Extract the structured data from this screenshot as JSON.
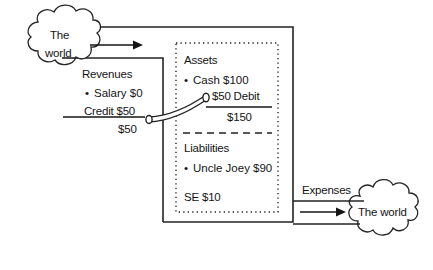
{
  "diagram": {
    "title_visible": false,
    "stroke_color": "#232323",
    "text_color": "#141414",
    "background": "#ffffff",
    "clouds": [
      {
        "name": "world-left",
        "line1": "The",
        "line2": "world"
      },
      {
        "name": "world-right",
        "line1": "The world",
        "line2": ""
      }
    ],
    "revenues_box": {
      "heading": "Revenues",
      "rows": [
        {
          "bullet": true,
          "label": "Salary $0"
        },
        {
          "bullet": false,
          "label": "Credit $50"
        }
      ],
      "total": "$50"
    },
    "ledger_box": {
      "assets": {
        "heading": "Assets",
        "rows": [
          {
            "bullet": true,
            "label": "Cash $100"
          },
          {
            "bullet": false,
            "label": "$50 Debit"
          }
        ],
        "total": "$150"
      },
      "liabilities": {
        "heading": "Liabilities",
        "rows": [
          {
            "bullet": true,
            "label": "Uncle Joey $90"
          }
        ],
        "equity": "SE $10"
      }
    },
    "expenses": {
      "label": "Expenses"
    },
    "arrows": [
      {
        "name": "inflow-arrow",
        "direction": "right"
      },
      {
        "name": "outflow-arrow",
        "direction": "right"
      }
    ],
    "pipe": {
      "name": "credit-to-debit-pipe",
      "from": "Credit $50",
      "to": "$50 Debit"
    }
  }
}
